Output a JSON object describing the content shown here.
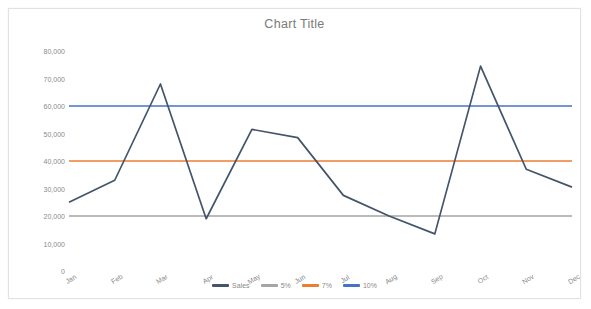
{
  "chart_data": {
    "type": "line",
    "title": "Chart Title",
    "xlabel": "",
    "ylabel": "",
    "grid": false,
    "legend_position": "bottom",
    "categories": [
      "Jan",
      "Feb",
      "Mar",
      "Apr",
      "May",
      "Jun",
      "Jul",
      "Aug",
      "Sep",
      "Oct",
      "Nov",
      "Dec"
    ],
    "ylim": [
      0,
      80000
    ],
    "ytick_values": [
      0,
      10000,
      20000,
      30000,
      40000,
      50000,
      60000,
      70000,
      80000
    ],
    "ytick_labels": [
      "0",
      "10,000",
      "20,000",
      "30,000",
      "40,000",
      "50,000",
      "60,000",
      "70,000",
      "80,000"
    ],
    "series": [
      {
        "name": "Sales",
        "color": "#44546A",
        "type": "line",
        "values": [
          25000,
          33000,
          68000,
          19000,
          51500,
          48500,
          27500,
          20000,
          13500,
          74500,
          37000,
          30500
        ]
      },
      {
        "name": "5%",
        "color": "#A5A5A5",
        "type": "constant-line",
        "constant": 20000,
        "values": [
          20000,
          20000,
          20000,
          20000,
          20000,
          20000,
          20000,
          20000,
          20000,
          20000,
          20000,
          20000
        ]
      },
      {
        "name": "7%",
        "color": "#ED7D31",
        "type": "constant-line",
        "constant": 40000,
        "values": [
          40000,
          40000,
          40000,
          40000,
          40000,
          40000,
          40000,
          40000,
          40000,
          40000,
          40000,
          40000
        ]
      },
      {
        "name": "10%",
        "color": "#4472C4",
        "type": "constant-line",
        "constant": 60000,
        "values": [
          60000,
          60000,
          60000,
          60000,
          60000,
          60000,
          60000,
          60000,
          60000,
          60000,
          60000,
          60000
        ]
      }
    ]
  },
  "style": {
    "background": "#ffffff",
    "frame_border": "#e2e2e2",
    "title_color": "#7a7a7a",
    "tick_color": "#8a8a8a"
  }
}
